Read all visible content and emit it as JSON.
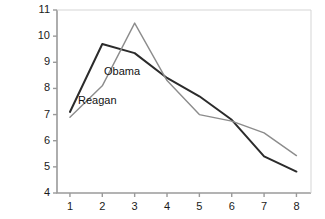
{
  "chart_data": {
    "type": "line",
    "title": "",
    "xlabel": "",
    "ylabel": "",
    "x": [
      1,
      2,
      3,
      4,
      5,
      6,
      7,
      8
    ],
    "xlim": [
      0.6,
      8.45
    ],
    "ylim": [
      4,
      11
    ],
    "xticks": [
      "1",
      "2",
      "3",
      "4",
      "5",
      "6",
      "7",
      "8"
    ],
    "yticks": [
      "4",
      "5",
      "6",
      "7",
      "8",
      "9",
      "10",
      "11"
    ],
    "grid": false,
    "legend_position": "inline-annotation",
    "series": [
      {
        "name": "Reagan",
        "color": "#2b2b2b",
        "width": 2.0,
        "values": [
          7.1,
          9.7,
          9.35,
          8.4,
          7.7,
          6.8,
          5.4,
          4.82
        ],
        "label_x": 78,
        "label_y": 94
      },
      {
        "name": "Obama",
        "color": "#8c8c8c",
        "width": 1.4,
        "values": [
          6.9,
          8.1,
          10.5,
          8.3,
          7.0,
          6.75,
          6.3,
          5.43
        ],
        "label_x": 104,
        "label_y": 65
      }
    ]
  },
  "axes": {
    "axis_color": "#9a9a9a",
    "tick_color": "#9a9a9a",
    "plot_left": 57,
    "plot_right": 311,
    "plot_top": 10,
    "plot_bottom": 193
  }
}
